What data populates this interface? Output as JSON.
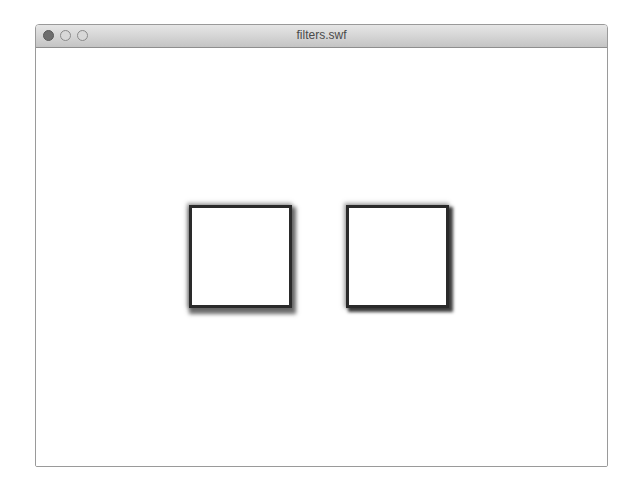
{
  "window": {
    "title": "filters.swf",
    "traffic_lights": [
      "close-button",
      "minimize-button",
      "zoom-button"
    ]
  },
  "stage": {
    "shapes": [
      {
        "type": "square",
        "label": "filtered-square-1",
        "fill": "#ffffff",
        "stroke": "#2a2a2a",
        "effect": "drop-shadow"
      },
      {
        "type": "square",
        "label": "filtered-square-2",
        "fill": "#ffffff",
        "stroke": "#2a2a2a",
        "effect": "drop-shadow"
      }
    ]
  }
}
